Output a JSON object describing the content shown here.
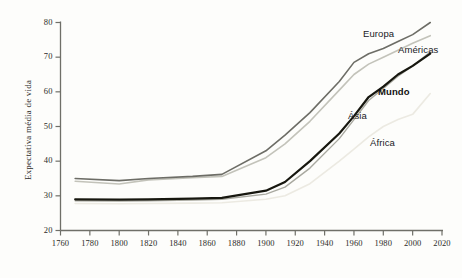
{
  "chart_data": {
    "type": "line",
    "title": "",
    "xlabel": "",
    "ylabel": "Expectativa média de vida",
    "xlim": [
      1760,
      2020
    ],
    "ylim": [
      20,
      80
    ],
    "xticks": [
      1760,
      1780,
      1800,
      1820,
      1840,
      1860,
      1880,
      1900,
      1920,
      1940,
      1960,
      1980,
      2000,
      2020
    ],
    "yticks": [
      20,
      30,
      40,
      50,
      60,
      70,
      80
    ],
    "grid": false,
    "legend_position": "inline-annotations",
    "series": [
      {
        "name": "Europa",
        "color": "#6d6d66",
        "width": 1.6,
        "label_x": 363,
        "label_y": 28,
        "bold": false,
        "x": [
          1770,
          1800,
          1820,
          1850,
          1870,
          1900,
          1913,
          1930,
          1950,
          1960,
          1970,
          1980,
          1990,
          2000,
          2012
        ],
        "y": [
          35.0,
          34.4,
          35.0,
          35.6,
          36.2,
          43.0,
          47.5,
          54.0,
          63.0,
          68.5,
          71.0,
          72.5,
          74.5,
          76.5,
          80.0
        ]
      },
      {
        "name": "Américas",
        "color": "#c3c3ba",
        "width": 1.6,
        "label_x": 398,
        "label_y": 44,
        "bold": false,
        "x": [
          1770,
          1800,
          1820,
          1850,
          1870,
          1900,
          1913,
          1930,
          1950,
          1960,
          1970,
          1980,
          1990,
          2000,
          2012
        ],
        "y": [
          34.2,
          33.4,
          34.6,
          35.2,
          35.6,
          41.0,
          45.0,
          51.5,
          60.5,
          65.0,
          68.0,
          70.0,
          72.0,
          74.0,
          76.2
        ]
      },
      {
        "name": "Mundo",
        "color": "#17170f",
        "width": 2.2,
        "label_x": 378,
        "label_y": 86,
        "bold": true,
        "x": [
          1770,
          1800,
          1820,
          1850,
          1870,
          1900,
          1913,
          1930,
          1950,
          1960,
          1970,
          1980,
          1990,
          2000,
          2012
        ],
        "y": [
          29.0,
          28.9,
          29.0,
          29.2,
          29.4,
          31.5,
          34.0,
          40.0,
          48.0,
          53.0,
          58.5,
          61.5,
          65.0,
          67.5,
          71.0
        ]
      },
      {
        "name": "Ásia",
        "color": "#a9a9a0",
        "width": 1.4,
        "label_x": 348,
        "label_y": 110,
        "bold": false,
        "x": [
          1770,
          1800,
          1820,
          1850,
          1870,
          1900,
          1913,
          1930,
          1950,
          1960,
          1970,
          1980,
          1990,
          2000,
          2012
        ],
        "y": [
          28.6,
          28.5,
          28.6,
          28.8,
          29.0,
          30.5,
          32.5,
          38.0,
          46.5,
          52.0,
          57.5,
          61.0,
          64.5,
          67.5,
          71.5
        ]
      },
      {
        "name": "África",
        "color": "#eceae2",
        "width": 1.6,
        "label_x": 370,
        "label_y": 137,
        "bold": false,
        "x": [
          1770,
          1800,
          1820,
          1850,
          1870,
          1900,
          1913,
          1930,
          1950,
          1960,
          1970,
          1980,
          1990,
          2000,
          2012
        ],
        "y": [
          27.8,
          27.7,
          27.8,
          27.9,
          28.0,
          29.0,
          30.0,
          33.5,
          40.0,
          43.5,
          47.0,
          50.0,
          52.0,
          53.5,
          59.5
        ]
      }
    ]
  },
  "axes": {
    "axis_color": "#6f6f68",
    "tick_color": "#6f6f68"
  }
}
